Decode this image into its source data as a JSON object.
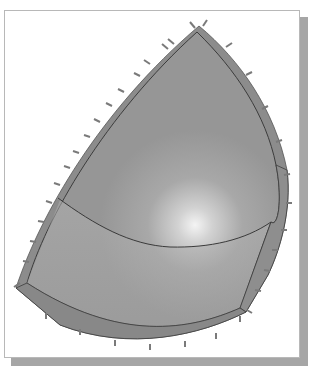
{
  "figure": {
    "colors": {
      "background": "#ffffff",
      "frame_border": "#b8b8b8",
      "frame_shadow": "#a6a6a6",
      "surface": "#9a9a9a",
      "surface_light": "#b4b4b4",
      "highlight": "#f2f2f2",
      "rim": "#8a8a8a",
      "edge_line": "#3c3c3c",
      "arrow": "#7a7a7a"
    },
    "regions": [
      {
        "name": "upper-surface-region"
      },
      {
        "name": "lower-surface-region"
      }
    ],
    "arrow_count_left": 15,
    "arrow_count_right": 13,
    "arrow_count_bottom": 7
  }
}
